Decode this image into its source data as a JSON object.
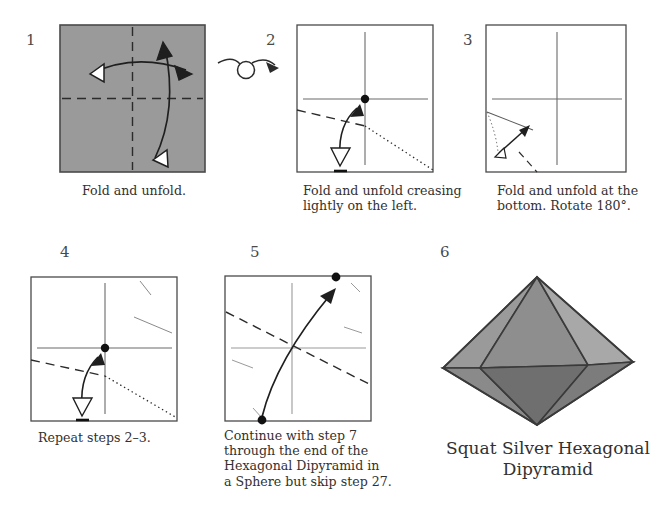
{
  "document": {
    "type": "origami-instruction-diagram",
    "background_color": "#ffffff",
    "paper_fill": "#9a9a9a",
    "line_color": "#2b2b2b"
  },
  "steps": [
    {
      "number": "1",
      "caption": "Fold and unfold.",
      "paper": "shaded-square",
      "creases": [
        "vertical-center-dashed",
        "horizontal-center-dashed"
      ],
      "arrows": [
        "double-headed-horizontal-fold-arrow",
        "double-headed-vertical-fold-arrow"
      ]
    },
    {
      "number": "2",
      "caption": "Fold and unfold creasing\nlightly on the left.",
      "paper": "white-square",
      "creases": [
        "vertical-center",
        "horizontal-center",
        "diagonal-valley-dashed",
        "diagonal-dotted"
      ],
      "marks": [
        "center-dot",
        "bottom-edge-tick"
      ],
      "arrows": [
        "fold-and-unfold-arrow"
      ]
    },
    {
      "number": "3",
      "caption": "Fold and unfold at the\nbottom. Rotate 180°.",
      "paper": "white-square",
      "creases": [
        "vertical-center",
        "horizontal-center",
        "corner-crease",
        "dashed-corner-fold"
      ],
      "arrows": [
        "small-fold-and-unfold-arrow"
      ]
    },
    {
      "number": "4",
      "caption": "Repeat steps 2–3.",
      "paper": "white-square",
      "creases": [
        "vertical-center",
        "horizontal-center",
        "diagonal-valley-dashed",
        "diagonal-dotted",
        "faint-creases"
      ],
      "marks": [
        "center-dot",
        "bottom-edge-tick"
      ],
      "arrows": [
        "fold-and-unfold-arrow"
      ]
    },
    {
      "number": "5",
      "caption": "Continue with step 7\nthrough the end of the\nHexagonal Dipyramid in\na Sphere but skip step 27.",
      "paper": "white-square",
      "creases": [
        "vertical-center",
        "horizontal-center",
        "long-diagonal-dashed",
        "faint-creases"
      ],
      "marks": [
        "top-right-dot",
        "bottom-left-dot"
      ],
      "arrows": [
        "long-fold-arrow"
      ]
    },
    {
      "number": "6",
      "caption": "Squat Silver Hexagonal\nDipyramid",
      "model": "hexagonal-dipyramid"
    }
  ],
  "symbols": {
    "turn_over": "turn-over-arrow"
  },
  "model": {
    "name": "Squat Silver Hexagonal Dipyramid",
    "face_colors": {
      "upper_left": "#9a9a9a",
      "upper_center": "#8e8e8e",
      "upper_right": "#a8a8a8",
      "far_left": "#9d9d9d",
      "far_right": "#a2a2a2",
      "lower_left": "#8a8a8a",
      "lower_center": "#6f6f6f",
      "lower_right": "#7c7c7c"
    },
    "edge_color": "#3a3a3a"
  }
}
